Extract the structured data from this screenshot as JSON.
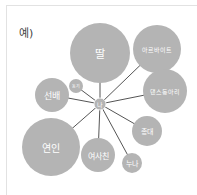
{
  "example_label": "예)",
  "center": {
    "label": "나",
    "x": 100,
    "y": 104,
    "r": 6
  },
  "nodes": [
    {
      "label": "딸",
      "x": 100,
      "y": 53,
      "r": 30,
      "size": 11
    },
    {
      "label": "아르바이트",
      "x": 157,
      "y": 49,
      "r": 24,
      "size": 6
    },
    {
      "label": "댄스동아리",
      "x": 165,
      "y": 91,
      "r": 22,
      "size": 6
    },
    {
      "label": "총대",
      "x": 147,
      "y": 131,
      "r": 15,
      "size": 7
    },
    {
      "label": "누나",
      "x": 132,
      "y": 163,
      "r": 10,
      "size": 7
    },
    {
      "label": "여사친",
      "x": 98,
      "y": 155,
      "r": 17,
      "size": 8
    },
    {
      "label": "연인",
      "x": 51,
      "y": 147,
      "r": 29,
      "size": 10
    },
    {
      "label": "선배",
      "x": 52,
      "y": 95,
      "r": 17,
      "size": 9
    },
    {
      "label": "동기",
      "x": 76,
      "y": 86,
      "r": 7,
      "size": 4
    }
  ],
  "colors": {
    "circle": "#b4b4b4",
    "line": "#555555",
    "text": "#ffffff"
  }
}
